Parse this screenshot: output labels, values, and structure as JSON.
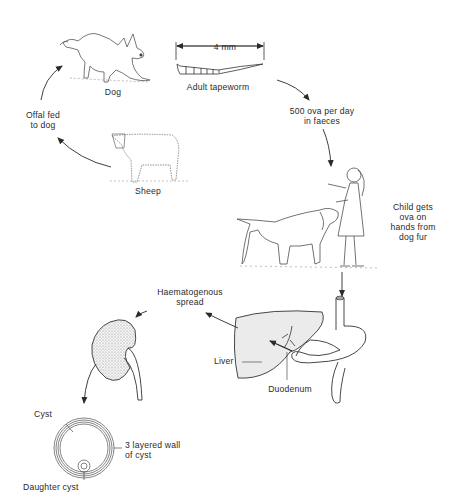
{
  "diagram": {
    "colors": {
      "line": "#2a2a2a",
      "fill_organ": "#ebebeb",
      "stipple": "#9a9a9a",
      "background": "#ffffff"
    },
    "nodes": {
      "dog": {
        "label": "Dog",
        "icon": "dog-illustration-icon"
      },
      "tapeworm": {
        "label": "Adult tapeworm",
        "icon": "tapeworm-illustration-icon",
        "scale_label": "4 mm"
      },
      "ova": {
        "label_line1": "500 ova per day",
        "label_line2": "in faeces"
      },
      "child": {
        "label_line1": "Child gets",
        "label_line2": "ova on",
        "label_line3": "hands from",
        "label_line4": "dog fur",
        "icon": "child-with-dog-illustration-icon"
      },
      "gut": {
        "liver_label": "Liver",
        "duodenum_label": "Duodenum",
        "icon": "liver-stomach-duodenum-icon"
      },
      "spread": {
        "label_line1": "Haematogenous",
        "label_line2": "spread"
      },
      "kidney": {
        "icon": "kidney-illustration-icon"
      },
      "cyst": {
        "cyst_label": "Cyst",
        "wall_label_line1": "3 layered wall",
        "wall_label_line2": "of cyst",
        "daughter_label": "Daughter cyst",
        "icon": "cyst-cross-section-icon"
      },
      "sheep": {
        "label": "Sheep",
        "icon": "sheep-illustration-icon"
      },
      "offal": {
        "label_line1": "Offal fed",
        "label_line2": "to dog"
      }
    },
    "arrows": [
      {
        "from": "tapeworm",
        "to": "ova"
      },
      {
        "from": "ova",
        "to": "child"
      },
      {
        "from": "child",
        "to": "gut"
      },
      {
        "from": "duodenum",
        "to": "liver"
      },
      {
        "from": "liver",
        "to": "kidney",
        "label": "Haematogenous spread"
      },
      {
        "from": "kidney",
        "to": "cyst"
      },
      {
        "from": "sheep",
        "to": "offal"
      },
      {
        "from": "offal",
        "to": "dog"
      }
    ]
  }
}
